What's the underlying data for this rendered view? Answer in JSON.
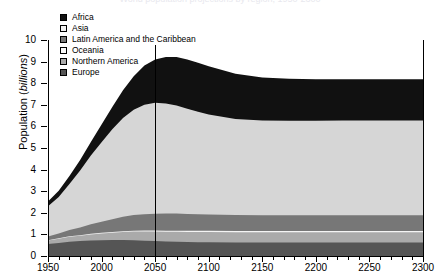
{
  "figure": {
    "cropped_title": "World population projections by region, 1950-2300"
  },
  "chart_data": {
    "type": "area",
    "stacked": true,
    "title": "",
    "xlabel": "",
    "ylabel": "Population (billions)",
    "ylabel_plain": "Population (",
    "ylabel_italic": "billions",
    "ylabel_tail": ")",
    "xlim": [
      1950,
      2300
    ],
    "ylim": [
      0,
      10
    ],
    "grid": false,
    "legend_position": "top-left",
    "xticks": [
      1950,
      2000,
      2050,
      2100,
      2150,
      2200,
      2250,
      2300
    ],
    "xtick_labels": [
      "1950",
      "2000",
      "2050",
      "2100",
      "2150",
      "2200",
      "2250",
      "2300"
    ],
    "xminor_step": 10,
    "yticks": [
      0,
      1,
      2,
      3,
      4,
      5,
      6,
      7,
      8,
      9,
      10
    ],
    "ytick_labels": [
      "0",
      "1",
      "2",
      "3",
      "4",
      "5",
      "6",
      "7",
      "8",
      "9",
      "10"
    ],
    "annotations": [
      {
        "name": "year-2050-marker",
        "type": "vline",
        "x": 2050,
        "label": ""
      }
    ],
    "x": [
      1950,
      1960,
      1970,
      1980,
      1990,
      2000,
      2010,
      2020,
      2030,
      2040,
      2050,
      2060,
      2070,
      2080,
      2090,
      2100,
      2125,
      2150,
      2175,
      2200,
      2225,
      2250,
      2275,
      2300
    ],
    "series": [
      {
        "name": "Europe",
        "color": "#555555",
        "stack_order": 1,
        "values": [
          0.55,
          0.6,
          0.66,
          0.69,
          0.72,
          0.73,
          0.74,
          0.74,
          0.73,
          0.71,
          0.69,
          0.67,
          0.66,
          0.65,
          0.64,
          0.64,
          0.63,
          0.63,
          0.63,
          0.63,
          0.63,
          0.63,
          0.63,
          0.63
        ]
      },
      {
        "name": "Northern America",
        "color": "#aaaaaa",
        "stack_order": 2,
        "values": [
          0.17,
          0.2,
          0.23,
          0.25,
          0.28,
          0.31,
          0.34,
          0.37,
          0.4,
          0.42,
          0.44,
          0.45,
          0.46,
          0.46,
          0.47,
          0.47,
          0.47,
          0.47,
          0.47,
          0.47,
          0.47,
          0.47,
          0.47,
          0.47
        ]
      },
      {
        "name": "Oceania",
        "color": "#f4f4f4",
        "stack_order": 3,
        "values": [
          0.013,
          0.016,
          0.019,
          0.023,
          0.027,
          0.031,
          0.035,
          0.04,
          0.044,
          0.047,
          0.05,
          0.052,
          0.054,
          0.055,
          0.056,
          0.057,
          0.058,
          0.058,
          0.058,
          0.058,
          0.058,
          0.058,
          0.058,
          0.058
        ]
      },
      {
        "name": "Latin America and the Caribbean",
        "color": "#777777",
        "stack_order": 4,
        "values": [
          0.17,
          0.22,
          0.29,
          0.36,
          0.44,
          0.52,
          0.59,
          0.67,
          0.72,
          0.76,
          0.78,
          0.79,
          0.79,
          0.78,
          0.77,
          0.76,
          0.74,
          0.73,
          0.73,
          0.73,
          0.73,
          0.73,
          0.73,
          0.73
        ]
      },
      {
        "name": "Asia",
        "color": "#d6d6d6",
        "stack_order": 5,
        "values": [
          1.4,
          1.7,
          2.14,
          2.64,
          3.18,
          3.68,
          4.16,
          4.57,
          4.88,
          5.07,
          5.14,
          5.1,
          5.0,
          4.87,
          4.74,
          4.62,
          4.44,
          4.38,
          4.37,
          4.37,
          4.38,
          4.38,
          4.38,
          4.38
        ]
      },
      {
        "name": "Africa",
        "color": "#111111",
        "stack_order": 6,
        "values": [
          0.22,
          0.28,
          0.37,
          0.48,
          0.63,
          0.82,
          1.03,
          1.28,
          1.55,
          1.81,
          2.0,
          2.15,
          2.25,
          2.28,
          2.27,
          2.24,
          2.1,
          2.0,
          1.95,
          1.93,
          1.92,
          1.92,
          1.92,
          1.92
        ]
      }
    ],
    "totals": [
      2.52,
      3.02,
      3.7,
      4.44,
      5.28,
      6.09,
      6.89,
      7.67,
      8.32,
      8.82,
      9.1,
      9.21,
      9.22,
      9.1,
      8.95,
      8.79,
      8.44,
      8.27,
      8.21,
      8.19,
      8.19,
      8.19,
      8.19,
      8.19
    ],
    "legend": [
      {
        "label": "Africa",
        "color": "#111111",
        "swatch": "filled-dark"
      },
      {
        "label": "Asia",
        "color": "#f2f2f2",
        "swatch": "outline-light"
      },
      {
        "label": "Latin America and the Caribbean",
        "color": "#777777",
        "swatch": "filled-mid-dark"
      },
      {
        "label": "Oceania",
        "color": "#fbfbfb",
        "swatch": "outline-light"
      },
      {
        "label": "Northern America",
        "color": "#aaaaaa",
        "swatch": "filled-mid"
      },
      {
        "label": "Europe",
        "color": "#555555",
        "swatch": "filled-dark-gray"
      }
    ]
  }
}
